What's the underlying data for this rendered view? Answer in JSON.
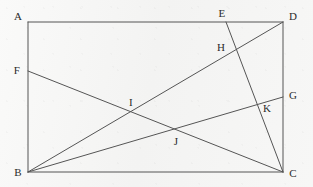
{
  "figure": {
    "kind": "geometry-diagram",
    "width": 313,
    "height": 187,
    "background_color": "#f6f6f5",
    "stroke_color": "#555555",
    "label_color": "#2b2b2b",
    "stroke_width": 1
  },
  "points": [
    {
      "id": "A",
      "label": "A",
      "x": 28,
      "y": 22,
      "label_x": 18,
      "label_y": 16,
      "role": "rectangle-corner-top-left"
    },
    {
      "id": "B",
      "label": "B",
      "x": 28,
      "y": 172,
      "label_x": 18,
      "label_y": 172,
      "role": "rectangle-corner-bottom-left"
    },
    {
      "id": "C",
      "label": "C",
      "x": 283,
      "y": 172,
      "label_x": 293,
      "label_y": 173,
      "role": "rectangle-corner-bottom-right"
    },
    {
      "id": "D",
      "label": "D",
      "x": 283,
      "y": 22,
      "label_x": 293,
      "label_y": 16,
      "role": "rectangle-corner-top-right"
    },
    {
      "id": "E",
      "label": "E",
      "x": 226,
      "y": 22,
      "label_x": 222,
      "label_y": 13,
      "role": "point-on-top-side"
    },
    {
      "id": "F",
      "label": "F",
      "x": 28,
      "y": 71,
      "label_x": 17,
      "label_y": 70,
      "role": "point-on-left-side"
    },
    {
      "id": "G",
      "label": "G",
      "x": 283,
      "y": 97,
      "label_x": 293,
      "label_y": 95,
      "role": "point-on-right-side"
    },
    {
      "id": "H",
      "label": "H",
      "x": 233,
      "y": 49,
      "label_x": 221,
      "label_y": 47,
      "role": "intersection-BD-EC"
    },
    {
      "id": "I",
      "label": "I",
      "x": 131,
      "y": 112,
      "label_x": 131,
      "label_y": 102,
      "role": "intersection-BD-FC"
    },
    {
      "id": "J",
      "label": "J",
      "x": 175,
      "y": 132,
      "label_x": 176,
      "label_y": 141,
      "role": "intersection-BG-FC"
    },
    {
      "id": "K",
      "label": "K",
      "x": 260,
      "y": 106,
      "label_x": 267,
      "label_y": 108,
      "role": "intersection-BG-EC"
    }
  ],
  "segments": [
    {
      "id": "side-AD",
      "from": "A",
      "to": "D",
      "name": "rectangle-top-side"
    },
    {
      "id": "side-DC",
      "from": "D",
      "to": "C",
      "name": "rectangle-right-side"
    },
    {
      "id": "side-CB",
      "from": "C",
      "to": "B",
      "name": "rectangle-bottom-side"
    },
    {
      "id": "side-BA",
      "from": "B",
      "to": "A",
      "name": "rectangle-left-side"
    },
    {
      "id": "diagonal-BD",
      "from": "B",
      "to": "D",
      "name": "diagonal-b-to-d"
    },
    {
      "id": "line-FC",
      "from": "F",
      "to": "C",
      "name": "segment-f-to-c"
    },
    {
      "id": "line-BG",
      "from": "B",
      "to": "G",
      "name": "segment-b-to-g"
    },
    {
      "id": "line-EC",
      "from": "E",
      "to": "C",
      "name": "segment-e-to-c"
    }
  ]
}
